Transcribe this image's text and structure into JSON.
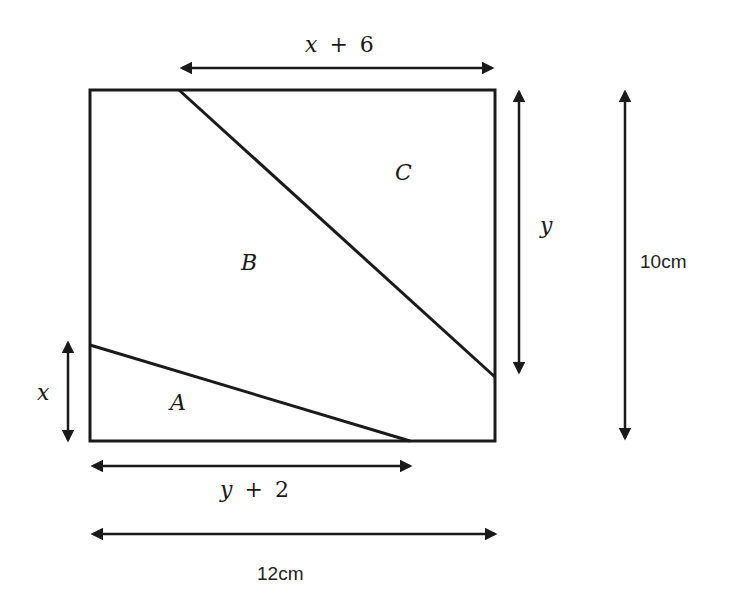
{
  "diagram": {
    "type": "geometry-rectangle-partition",
    "rectangle": {
      "width_label": "12cm",
      "height_label": "10cm"
    },
    "regions": [
      {
        "id": "A",
        "label": "A"
      },
      {
        "id": "B",
        "label": "B"
      },
      {
        "id": "C",
        "label": "C"
      }
    ],
    "dimensions": {
      "top": {
        "var": "x",
        "op": "+",
        "num": "6"
      },
      "right_inner": {
        "var": "y"
      },
      "left": {
        "var": "x"
      },
      "bottom_inner": {
        "var": "y",
        "op": "+",
        "num": "2"
      },
      "bottom_outer": "12cm",
      "right_outer": "10cm"
    },
    "colors": {
      "stroke": "#1a1a1a",
      "background": "#ffffff"
    }
  }
}
